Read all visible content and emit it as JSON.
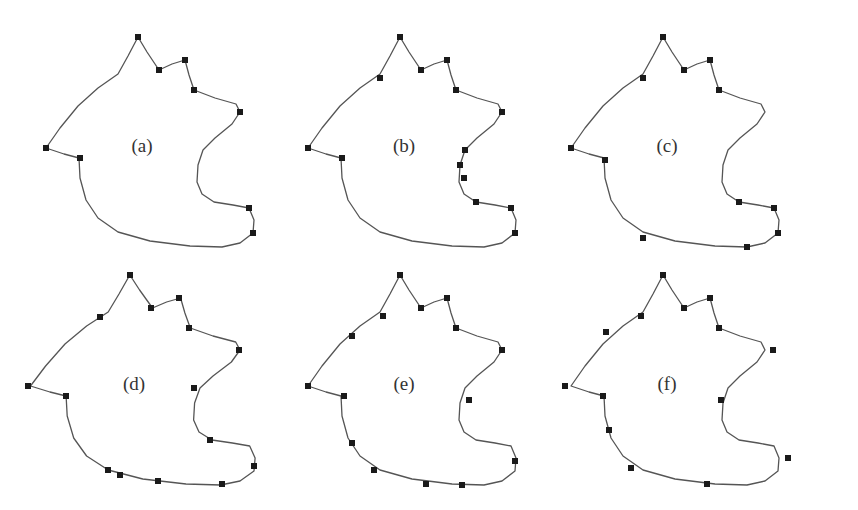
{
  "figure": {
    "stroke_color": "#555555",
    "point_color": "#1a1a1a",
    "background": "#ffffff",
    "contour": [
      [
        138,
        37
      ],
      [
        147,
        52
      ],
      [
        159,
        70
      ],
      [
        172,
        64
      ],
      [
        185,
        60
      ],
      [
        189,
        75
      ],
      [
        194,
        90
      ],
      [
        215,
        98
      ],
      [
        236,
        104
      ],
      [
        240,
        112
      ],
      [
        232,
        124
      ],
      [
        215,
        138
      ],
      [
        203,
        150
      ],
      [
        198,
        165
      ],
      [
        197,
        182
      ],
      [
        202,
        194
      ],
      [
        214,
        202
      ],
      [
        233,
        205
      ],
      [
        249,
        208
      ],
      [
        254,
        220
      ],
      [
        253,
        233
      ],
      [
        240,
        243
      ],
      [
        222,
        247
      ],
      [
        190,
        246
      ],
      [
        150,
        241
      ],
      [
        118,
        232
      ],
      [
        98,
        218
      ],
      [
        86,
        200
      ],
      [
        80,
        178
      ],
      [
        79,
        158
      ],
      [
        64,
        154
      ],
      [
        46,
        148
      ],
      [
        60,
        128
      ],
      [
        78,
        106
      ],
      [
        98,
        88
      ],
      [
        118,
        74
      ],
      [
        128,
        56
      ],
      [
        138,
        37
      ]
    ],
    "panels": [
      {
        "label": "(a)",
        "dx": 0,
        "dy": 0,
        "label_x": 142,
        "label_y": 152,
        "points": [
          [
            138,
            37
          ],
          [
            159,
            70
          ],
          [
            185,
            60
          ],
          [
            194,
            90
          ],
          [
            240,
            112
          ],
          [
            249,
            208
          ],
          [
            253,
            233
          ],
          [
            80,
            158
          ],
          [
            46,
            148
          ]
        ]
      },
      {
        "label": "(b)",
        "dx": 262,
        "dy": 0,
        "label_x": 142,
        "label_y": 152,
        "points": [
          [
            138,
            37
          ],
          [
            159,
            70
          ],
          [
            185,
            60
          ],
          [
            194,
            90
          ],
          [
            240,
            112
          ],
          [
            203,
            150
          ],
          [
            198,
            165
          ],
          [
            202,
            178
          ],
          [
            214,
            202
          ],
          [
            249,
            208
          ],
          [
            253,
            233
          ],
          [
            80,
            158
          ],
          [
            46,
            148
          ],
          [
            118,
            78
          ]
        ]
      },
      {
        "label": "(c)",
        "dx": 525,
        "dy": 0,
        "label_x": 142,
        "label_y": 152,
        "points": [
          [
            138,
            37
          ],
          [
            159,
            70
          ],
          [
            185,
            60
          ],
          [
            194,
            90
          ],
          [
            214,
            202
          ],
          [
            249,
            208
          ],
          [
            253,
            233
          ],
          [
            222,
            247
          ],
          [
            118,
            238
          ],
          [
            80,
            160
          ],
          [
            46,
            148
          ],
          [
            118,
            78
          ]
        ]
      },
      {
        "label": "(d)",
        "dx": -16,
        "dy": 238,
        "label_x": 150,
        "label_y": 152,
        "points": [
          [
            146,
            37
          ],
          [
            167,
            70
          ],
          [
            195,
            60
          ],
          [
            205,
            90
          ],
          [
            255,
            112
          ],
          [
            210,
            150
          ],
          [
            226,
            202
          ],
          [
            270,
            228
          ],
          [
            238,
            246
          ],
          [
            174,
            243
          ],
          [
            136,
            237
          ],
          [
            124,
            232
          ],
          [
            82,
            158
          ],
          [
            44,
            148
          ],
          [
            116,
            79
          ]
        ]
      },
      {
        "label": "(e)",
        "dx": 262,
        "dy": 238,
        "label_x": 142,
        "label_y": 152,
        "points": [
          [
            138,
            37
          ],
          [
            159,
            70
          ],
          [
            185,
            60
          ],
          [
            194,
            90
          ],
          [
            240,
            112
          ],
          [
            207,
            162
          ],
          [
            253,
            223
          ],
          [
            200,
            247
          ],
          [
            164,
            246
          ],
          [
            112,
            232
          ],
          [
            90,
            205
          ],
          [
            82,
            158
          ],
          [
            46,
            148
          ],
          [
            90,
            98
          ],
          [
            121,
            78
          ]
        ]
      },
      {
        "label": "(f)",
        "dx": 525,
        "dy": 238,
        "label_x": 142,
        "label_y": 152,
        "points": [
          [
            138,
            37
          ],
          [
            159,
            70
          ],
          [
            185,
            60
          ],
          [
            194,
            90
          ],
          [
            248,
            112
          ],
          [
            196,
            162
          ],
          [
            263,
            220
          ],
          [
            182,
            246
          ],
          [
            106,
            230
          ],
          [
            84,
            192
          ],
          [
            78,
            158
          ],
          [
            40,
            148
          ],
          [
            81,
            94
          ],
          [
            116,
            78
          ]
        ]
      }
    ]
  }
}
